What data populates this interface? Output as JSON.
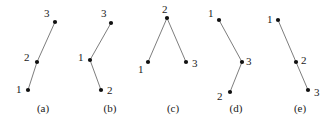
{
  "figure": {
    "background_color": "#ffffff",
    "line_color": "#6e6e6e",
    "dot_color": "#111111",
    "text_color": "#1a1a1a",
    "width": 332,
    "height": 127
  },
  "chart_data": {
    "type": "scatter",
    "title": "",
    "xlabel": "",
    "ylabel": "",
    "grid": false,
    "legend": null,
    "panels": [
      {
        "caption": "(a)",
        "shape": "ascending-line",
        "points": [
          {
            "label": "1",
            "x": 28,
            "y": 90,
            "label_x": 16,
            "label_y": 84
          },
          {
            "label": "2",
            "x": 37,
            "y": 62,
            "label_x": 24,
            "label_y": 52
          },
          {
            "label": "3",
            "x": 55,
            "y": 22,
            "label_x": 44,
            "label_y": 8
          }
        ],
        "edges": [
          [
            0,
            1
          ],
          [
            1,
            2
          ]
        ]
      },
      {
        "caption": "(b)",
        "shape": "zigzag-left-vertex",
        "points": [
          {
            "label": "1",
            "x": 90,
            "y": 60,
            "label_x": 78,
            "label_y": 52
          },
          {
            "label": "2",
            "x": 101,
            "y": 90,
            "label_x": 107,
            "label_y": 85
          },
          {
            "label": "3",
            "x": 111,
            "y": 23,
            "label_x": 101,
            "label_y": 8
          }
        ],
        "edges": [
          [
            0,
            2
          ],
          [
            0,
            1
          ]
        ]
      },
      {
        "caption": "(c)",
        "shape": "inverted-v",
        "points": [
          {
            "label": "1",
            "x": 148,
            "y": 62,
            "label_x": 138,
            "label_y": 64
          },
          {
            "label": "2",
            "x": 167,
            "y": 18,
            "label_x": 162,
            "label_y": 4
          },
          {
            "label": "3",
            "x": 186,
            "y": 62,
            "label_x": 192,
            "label_y": 58
          }
        ],
        "edges": [
          [
            1,
            0
          ],
          [
            1,
            2
          ]
        ]
      },
      {
        "caption": "(d)",
        "shape": "zigzag-right-vertex",
        "points": [
          {
            "label": "1",
            "x": 219,
            "y": 20,
            "label_x": 208,
            "label_y": 8
          },
          {
            "label": "2",
            "x": 230,
            "y": 92,
            "label_x": 217,
            "label_y": 91
          },
          {
            "label": "3",
            "x": 242,
            "y": 62,
            "label_x": 246,
            "label_y": 56
          }
        ],
        "edges": [
          [
            0,
            2
          ],
          [
            2,
            1
          ]
        ]
      },
      {
        "caption": "(e)",
        "shape": "descending-line",
        "points": [
          {
            "label": "1",
            "x": 278,
            "y": 20,
            "label_x": 267,
            "label_y": 14
          },
          {
            "label": "2",
            "x": 296,
            "y": 62,
            "label_x": 301,
            "label_y": 55
          },
          {
            "label": "3",
            "x": 308,
            "y": 90,
            "label_x": 314,
            "label_y": 87
          }
        ],
        "edges": [
          [
            0,
            1
          ],
          [
            1,
            2
          ]
        ]
      }
    ],
    "captions": [
      "(a)",
      "(b)",
      "(c)",
      "(d)",
      "(e)"
    ],
    "caption_centers": [
      43,
      110,
      173,
      236,
      300
    ]
  }
}
